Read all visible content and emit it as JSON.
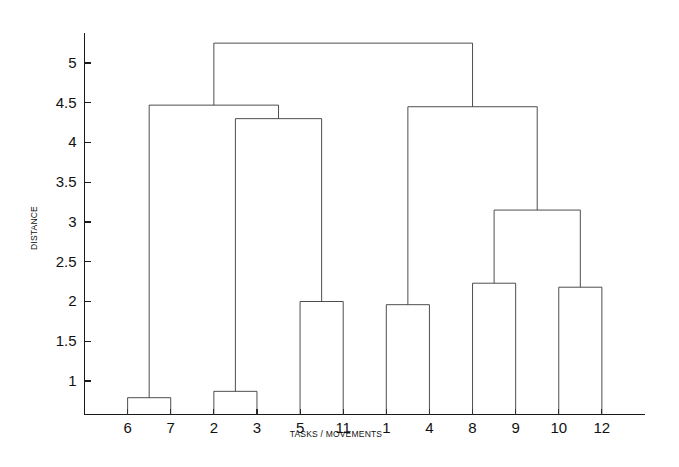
{
  "chart_data": {
    "type": "dendrogram",
    "title": "",
    "subtitle": "",
    "xlabel": "TASKS / MOVEMENTS",
    "ylabel": "DISTANCE",
    "grid": false,
    "legend": "none",
    "xlim": [
      0,
      13
    ],
    "ylim": [
      0.55,
      5.45
    ],
    "yticks": [
      1,
      1.5,
      2,
      2.5,
      3,
      3.5,
      4,
      4.5,
      5
    ],
    "ytick_labels": [
      "1",
      "1.5",
      "2",
      "2.5",
      "3",
      "3.5",
      "4",
      "4.5",
      "5"
    ],
    "leaf_order": [
      6,
      7,
      2,
      3,
      5,
      11,
      1,
      4,
      8,
      9,
      10,
      12
    ],
    "leaf_labels": [
      "6",
      "7",
      "2",
      "3",
      "5",
      "11",
      "1",
      "4",
      "8",
      "9",
      "10",
      "12"
    ],
    "baseline_value": 0.58,
    "merges": [
      {
        "id": "m1",
        "label": "6-7",
        "left": "6",
        "right": "7",
        "height": 0.79
      },
      {
        "id": "m2",
        "label": "2-3",
        "left": "2",
        "right": "3",
        "height": 0.87
      },
      {
        "id": "m3",
        "label": "5-11",
        "left": "5",
        "right": "11",
        "height": 2.0
      },
      {
        "id": "m4",
        "label": "1-4",
        "left": "1",
        "right": "4",
        "height": 1.96
      },
      {
        "id": "m5",
        "label": "8-9",
        "left": "8",
        "right": "9",
        "height": 2.23
      },
      {
        "id": "m6",
        "label": "10-12",
        "left": "10",
        "right": "12",
        "height": 2.18
      },
      {
        "id": "m7",
        "label": "(8-9)-(10-12)",
        "left": "m5",
        "right": "m6",
        "height": 3.15
      },
      {
        "id": "m8",
        "label": "(2-3)-(5-11)",
        "left": "m2",
        "right": "m3",
        "height": 4.3
      },
      {
        "id": "m9",
        "label": "(1-4)-((8-9)-(10-12))",
        "left": "m4",
        "right": "m7",
        "height": 4.45
      },
      {
        "id": "m10",
        "label": "(6-7)-((2-3)-(5-11))",
        "left": "m1",
        "right": "m8",
        "height": 4.47
      },
      {
        "id": "m11",
        "label": "root",
        "left": "m10",
        "right": "m9",
        "height": 5.25
      }
    ],
    "line_color": "#3a3a3a",
    "axis_color": "#1a1a1a",
    "background_color": "#ffffff"
  }
}
